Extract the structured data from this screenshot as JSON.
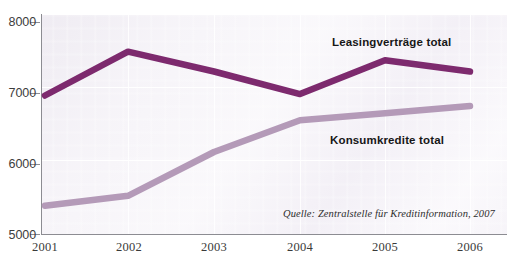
{
  "chart_data": {
    "type": "line",
    "title": "",
    "xlabel": "",
    "ylabel": "",
    "categories": [
      "2001",
      "2002",
      "2003",
      "2004",
      "2005",
      "2006"
    ],
    "x_tick_labels": [
      "2001",
      "2002",
      "2003",
      "2004",
      "2005",
      "2006"
    ],
    "y_tick_labels": [
      "5000",
      "6000",
      "7000",
      "8000"
    ],
    "y_ticks": [
      5000,
      6000,
      7000,
      8000
    ],
    "ylim": [
      5000,
      8000
    ],
    "grid": true,
    "legend_position": "inline-annotations",
    "series": [
      {
        "name": "Leasingverträge total",
        "color": "#7d2a6e",
        "values": [
          6960,
          7580,
          7300,
          6980,
          7460,
          7300
        ]
      },
      {
        "name": "Konsumkredite total",
        "color": "#b49ab8",
        "values": [
          5400,
          5540,
          6160,
          6610,
          6710,
          6810
        ]
      }
    ],
    "annotations": [
      {
        "text": "Leasingverträge total",
        "x": 388,
        "y": 43
      },
      {
        "text": "Konsumkredite total",
        "x": 384,
        "y": 141
      }
    ],
    "source": "Quelle: Zentralstelle für Kreditinformation, 2007"
  },
  "axes": {
    "y": {
      "labels": [
        {
          "text": "8000",
          "top": 15
        },
        {
          "text": "7000",
          "top": 86
        },
        {
          "text": "6000",
          "top": 157
        },
        {
          "text": "5000",
          "top": 228
        }
      ]
    },
    "x": {
      "labels": [
        {
          "text": "2001",
          "left": 15
        },
        {
          "text": "2002",
          "left": 99
        },
        {
          "text": "2003",
          "left": 184
        },
        {
          "text": "2004",
          "left": 270
        },
        {
          "text": "2005",
          "left": 355
        },
        {
          "text": "2006",
          "left": 440
        }
      ]
    }
  },
  "series_labels": {
    "leasing": "Leasingverträge total",
    "konsum": "Konsumkredite total"
  },
  "source_note": "Quelle: Zentralstelle für Kreditinformation, 2007",
  "colors": {
    "leasing_line": "#7d2a6e",
    "konsum_line": "#b49ab8",
    "axis": "#8c8c92",
    "plot_bg": "#f0edf4"
  }
}
